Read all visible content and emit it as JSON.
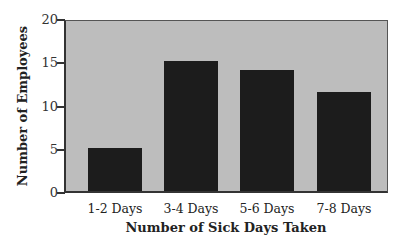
{
  "chart_data": {
    "type": "bar",
    "title": "",
    "categories": [
      "1-2 Days",
      "3-4 Days",
      "5-6 Days",
      "7-8 Days"
    ],
    "values": [
      5,
      15,
      14,
      11.5
    ],
    "xlabel": "Number of Sick Days Taken",
    "ylabel": "Number of Employees",
    "ylim": [
      0,
      20
    ],
    "yticks": [
      0,
      5,
      10,
      15,
      20
    ],
    "grid": false,
    "legend": null,
    "colors": {
      "bar": "#1c1c1c",
      "plot_background": "#bdbdbd",
      "axis": "#333333"
    }
  },
  "labels": {
    "yticks": [
      "0",
      "5",
      "10",
      "15",
      "20"
    ],
    "xticks": [
      "1-2 Days",
      "3-4 Days",
      "5-6 Days",
      "7-8 Days"
    ],
    "xtitle": "Number of Sick Days Taken",
    "ytitle": "Number of Employees"
  }
}
